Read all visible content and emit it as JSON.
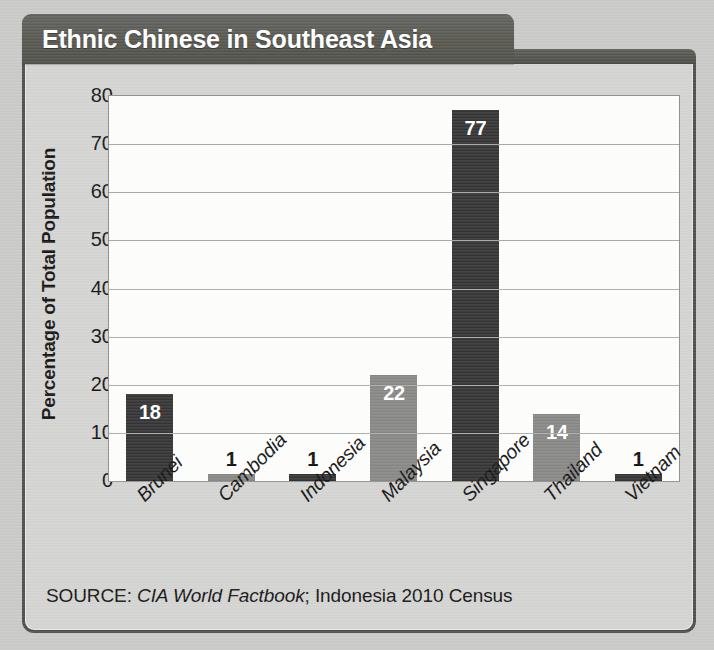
{
  "title": "Ethnic Chinese in Southeast Asia",
  "source": {
    "prefix": "SOURCE: ",
    "italic_part": "CIA World Factbook",
    "suffix": "; Indonesia 2010 Census"
  },
  "colors": {
    "bar_dark": "#343434",
    "bar_light": "#878785",
    "panel_background": "#d3d3d1",
    "plot_background": "#fdfdfc",
    "title_bar": "#56564f",
    "gridline": "#a9a9a7",
    "page_background": "#c9c9c7"
  },
  "chart_data": {
    "type": "bar",
    "title": "Ethnic Chinese in Southeast Asia",
    "xlabel": "",
    "ylabel": "Percentage of Total Population",
    "ylim": [
      0,
      80
    ],
    "ytick_labels": [
      "80",
      "70",
      "60",
      "50",
      "40",
      "30",
      "20",
      "10",
      "0"
    ],
    "yticks": [
      80,
      70,
      60,
      50,
      40,
      30,
      20,
      10,
      0
    ],
    "grid": true,
    "legend": null,
    "categories": [
      "Brunei",
      "Cambodia",
      "Indonesia",
      "Malaysia",
      "Singapore",
      "Thailand",
      "Vietnam"
    ],
    "values": [
      18,
      1,
      1,
      22,
      77,
      14,
      1
    ],
    "value_labels": [
      "18",
      "1",
      "1",
      "22",
      "77",
      "14",
      "1"
    ],
    "bar_styles": [
      "dark",
      "light",
      "dark",
      "light",
      "dark",
      "light",
      "dark"
    ],
    "label_placement": [
      "inside",
      "outside",
      "outside",
      "inside",
      "inside",
      "inside",
      "outside"
    ]
  }
}
